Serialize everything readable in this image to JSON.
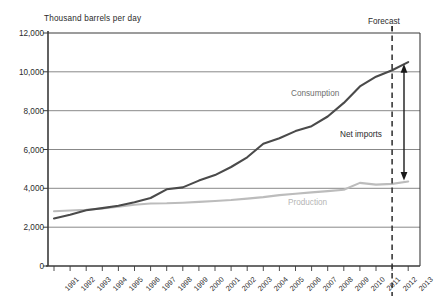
{
  "chart_data": {
    "type": "line",
    "title": "",
    "ylabel": "Thousand barrels per day",
    "xlabel": "",
    "ylim": [
      0,
      12000
    ],
    "ytick_labels": [
      "0",
      "2,000",
      "4,000",
      "6,000",
      "8,000",
      "10,000",
      "12,000"
    ],
    "ytick_values": [
      0,
      2000,
      4000,
      6000,
      8000,
      10000,
      12000
    ],
    "grid": "horizontal",
    "legend_position": "inline-labels",
    "categories": [
      1991,
      1992,
      1993,
      1994,
      1995,
      1996,
      1997,
      1998,
      1999,
      2000,
      2001,
      2002,
      2003,
      2004,
      2005,
      2006,
      2007,
      2008,
      2009,
      2010,
      2011,
      2012,
      2013
    ],
    "xtick_labels": [
      "1991",
      "1992",
      "1993",
      "1994",
      "1995",
      "1996",
      "1997",
      "1998",
      "1999",
      "2000",
      "2001",
      "2002",
      "2003",
      "2004",
      "2005",
      "2006",
      "2007",
      "2008",
      "2009",
      "2010",
      "2011",
      "2012",
      "2013"
    ],
    "series": [
      {
        "name": "Consumption",
        "color": "#4a4a4a",
        "values": [
          2450,
          2640,
          2870,
          2980,
          3100,
          3280,
          3500,
          3950,
          4050,
          4400,
          4680,
          5100,
          5600,
          6300,
          6580,
          6950,
          7200,
          7700,
          8400,
          9250,
          9750,
          10080,
          10500
        ]
      },
      {
        "name": "Production",
        "color": "#bcbcbc",
        "values": [
          2820,
          2860,
          2900,
          2960,
          3060,
          3150,
          3220,
          3230,
          3260,
          3300,
          3350,
          3400,
          3470,
          3550,
          3650,
          3720,
          3790,
          3860,
          3930,
          4280,
          4190,
          4230,
          4350
        ]
      }
    ],
    "annotations": [
      {
        "name": "forecast",
        "text": "Forecast",
        "at_x": 2012
      },
      {
        "name": "consumption-label",
        "text": "Consumption"
      },
      {
        "name": "net-imports-label",
        "text": "Net imports"
      },
      {
        "name": "production-label",
        "text": "Production"
      }
    ],
    "forecast_divider": {
      "x": 2012,
      "style": "dashed"
    },
    "net_imports_arrow": {
      "x": 2013,
      "y_top": 10400,
      "y_bottom": 4400,
      "style": "double-headed"
    }
  },
  "colors": {
    "consumption": "#4a4a4a",
    "production": "#bcbcbc",
    "grid": "#6a6a6a",
    "axis": "#3a3a3a",
    "background": "#ffffff"
  }
}
